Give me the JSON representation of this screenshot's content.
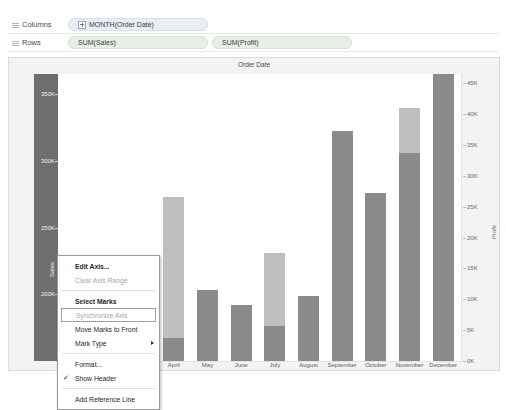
{
  "shelves": {
    "columns": {
      "label": "Columns",
      "icon": "columns-grip-icon",
      "pills": [
        {
          "text": "MONTH(Order Date)",
          "icon": "expand-plus-icon"
        }
      ]
    },
    "rows": {
      "label": "Rows",
      "icon": "rows-grip-icon",
      "pills": [
        {
          "text": "SUM(Sales)"
        },
        {
          "text": "SUM(Profit)"
        }
      ]
    }
  },
  "chart_data": {
    "type": "bar",
    "title": "Order Date",
    "xlabel": "",
    "ylabel": "Sales",
    "y2label": "Profit",
    "ylim": [
      150000,
      365000
    ],
    "y2lim": [
      0,
      46500
    ],
    "grid": false,
    "legend": "none",
    "categories": [
      "January",
      "February",
      "March",
      "April",
      "May",
      "June",
      "July",
      "August",
      "September",
      "October",
      "November",
      "December"
    ],
    "yticks": [
      "350K",
      "300K",
      "250K",
      "200K"
    ],
    "ytick_values": [
      350000,
      300000,
      250000,
      200000
    ],
    "y2ticks": [
      "45K",
      "40K",
      "35K",
      "30K",
      "25K",
      "20K",
      "15K",
      "10K",
      "5K",
      "0K"
    ],
    "y2tick_values": [
      45000,
      40000,
      35000,
      30000,
      25000,
      20000,
      15000,
      10000,
      5000,
      0
    ],
    "series": [
      {
        "name": "SUM(Sales)",
        "color": "#8b8b8b",
        "values": [
          null,
          null,
          218000,
          167000,
          203000,
          192000,
          176000,
          199000,
          322000,
          276000,
          306000,
          365000
        ]
      },
      {
        "name": "SUM(Profit)",
        "color": "#bfbfbf",
        "values": [
          null,
          null,
          null,
          26500,
          null,
          null,
          17500,
          null,
          37000,
          null,
          41000,
          null
        ]
      }
    ],
    "note_occluded": "January and February bars are hidden behind the open context menu"
  },
  "context_menu": {
    "items": [
      {
        "label": "Edit Axis...",
        "state": "bold",
        "name": "menu-item-edit-axis"
      },
      {
        "label": "Clear Axis Range",
        "state": "disabled",
        "name": "menu-item-clear-axis-range"
      },
      {
        "separator": true
      },
      {
        "label": "Select Marks",
        "state": "bold",
        "name": "menu-item-select-marks"
      },
      {
        "label": "Synchronize Axis",
        "state": "disabled-focused",
        "name": "menu-item-synchronize-axis"
      },
      {
        "label": "Move Marks to Front",
        "state": "normal",
        "name": "menu-item-move-marks-to-front"
      },
      {
        "label": "Mark Type",
        "state": "submenu",
        "name": "menu-item-mark-type",
        "icon": "chevron-right-icon"
      },
      {
        "separator": true
      },
      {
        "label": "Format...",
        "state": "normal",
        "name": "menu-item-format"
      },
      {
        "label": "Show Header",
        "state": "checked",
        "name": "menu-item-show-header",
        "icon": "check-icon"
      },
      {
        "separator": true
      },
      {
        "label": "Add Reference Line",
        "state": "normal",
        "name": "menu-item-add-reference-line"
      }
    ]
  },
  "colors": {
    "sales_bar": "#8b8b8b",
    "profit_bar": "#bfbfbf",
    "selected_axis": "#6e6e6e",
    "viz_background": "#f3f3f3",
    "plot_background": "#ffffff"
  }
}
